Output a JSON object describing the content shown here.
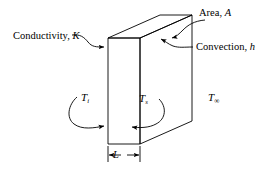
{
  "diagram": {
    "type": "heat-transfer-schematic",
    "colors": {
      "stroke": "#000000",
      "background": "#ffffff"
    },
    "labels": {
      "conductivity": {
        "text": "Conductivity,",
        "symbol": "K"
      },
      "area": {
        "text": "Area,",
        "symbol": "A"
      },
      "convection": {
        "text": "Convection,",
        "symbol": "h"
      },
      "temp_inner": {
        "symbol": "T",
        "subscript": "i"
      },
      "temp_surface": {
        "symbol": "T",
        "subscript": "s"
      },
      "temp_ambient": {
        "symbol": "T",
        "subscript": "∞"
      },
      "thickness": {
        "symbol": "L"
      }
    },
    "geometry": {
      "front_face": {
        "x": 108,
        "y": 38,
        "width": 32,
        "height": 106
      },
      "depth_offset_x": 52,
      "depth_offset_y": -23,
      "description": "Rectangular slab drawn in oblique projection, thin front face with depth receding up and to the right"
    },
    "annotations": [
      {
        "name": "conductivity-leader",
        "points_to": "front-left-face-top"
      },
      {
        "name": "area-leader",
        "points_to": "right-side-face-top"
      },
      {
        "name": "convection-leader",
        "points_to": "right-side-face"
      },
      {
        "name": "temp-inner-arrow",
        "points_to": "front-face-left-edge"
      },
      {
        "name": "temp-surface-arrow",
        "points_to": "front-face-left-edge"
      },
      {
        "name": "thickness-dimension",
        "measures": "front face thickness L"
      }
    ]
  }
}
